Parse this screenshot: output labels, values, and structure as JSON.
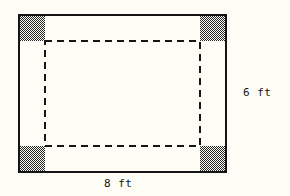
{
  "figure": {
    "type": "geometry-diagram",
    "background_color": "#fdfdf6",
    "stroke_color": "#151515",
    "shade_color": "#4a4a4a",
    "outer_rectangle": {
      "name": "outer-rectangle",
      "x": 19,
      "y": 15,
      "width": 207,
      "height": 157,
      "stroke_width": 2,
      "fill": "none"
    },
    "inner_dashed_rectangle": {
      "name": "inner-dashed-rectangle",
      "x": 45,
      "y": 41,
      "width": 155,
      "height": 105,
      "stroke_width": 2,
      "dash_pattern": "7 5",
      "fill": "none"
    },
    "corner_squares": [
      {
        "name": "corner-square-top-left",
        "x": 19,
        "y": 15,
        "size": 26
      },
      {
        "name": "corner-square-top-right",
        "x": 200,
        "y": 15,
        "size": 26
      },
      {
        "name": "corner-square-bottom-left",
        "x": 19,
        "y": 146,
        "size": 26
      },
      {
        "name": "corner-square-bottom-right",
        "x": 200,
        "y": 146,
        "size": 26
      }
    ]
  },
  "labels": {
    "height": "6 ft",
    "width": "8 ft"
  }
}
